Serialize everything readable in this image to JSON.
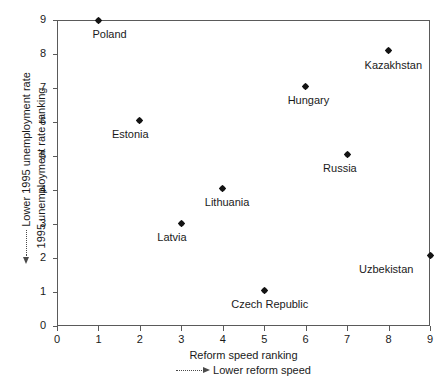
{
  "chart_data": {
    "type": "scatter",
    "title": "",
    "xlabel": "Reform speed ranking",
    "xlabel_note": "Lower reform speed",
    "xlabel_note_arrow": "right",
    "ylabel": "1995 unemployment rate ranking",
    "ylabel_note": "Lower 1995 unemployment rate",
    "ylabel_note_arrow": "left",
    "xlim": [
      0,
      9
    ],
    "ylim": [
      0,
      9
    ],
    "xticks": [
      0,
      1,
      2,
      3,
      4,
      5,
      6,
      7,
      8,
      9
    ],
    "yticks": [
      0,
      1,
      2,
      3,
      4,
      5,
      6,
      7,
      8,
      9
    ],
    "xticklabels": [
      "0",
      "1",
      "2",
      "3",
      "4",
      "5",
      "6",
      "7",
      "8",
      "9"
    ],
    "yticklabels": [
      "0",
      "1",
      "2",
      "3",
      "4",
      "5",
      "6",
      "7",
      "8",
      "9"
    ],
    "grid": false,
    "legend": "none",
    "marker": "diamond",
    "marker_color": "#141414",
    "frame_color": "#5a5a5a",
    "points": [
      {
        "label": "Poland",
        "x": 1,
        "y": 9.0,
        "label_dx": -6,
        "label_dy": 8
      },
      {
        "label": "Estonia",
        "x": 2,
        "y": 6.05,
        "label_dx": -28,
        "label_dy": 8
      },
      {
        "label": "Latvia",
        "x": 3,
        "y": 3.02,
        "label_dx": -24,
        "label_dy": 8
      },
      {
        "label": "Lithuania",
        "x": 4,
        "y": 4.05,
        "label_dx": -18,
        "label_dy": 8
      },
      {
        "label": "Czech Republic",
        "x": 5,
        "y": 1.05,
        "label_dx": -33,
        "label_dy": 8
      },
      {
        "label": "Hungary",
        "x": 6,
        "y": 7.05,
        "label_dx": -18,
        "label_dy": 8
      },
      {
        "label": "Russia",
        "x": 7,
        "y": 5.05,
        "label_dx": -24,
        "label_dy": 8
      },
      {
        "label": "Kazakhstan",
        "x": 8,
        "y": 8.1,
        "label_dx": -24,
        "label_dy": 8
      },
      {
        "label": "Uzbekistan",
        "x": 9,
        "y": 2.08,
        "label_dx": -71,
        "label_dy": 8
      }
    ]
  }
}
